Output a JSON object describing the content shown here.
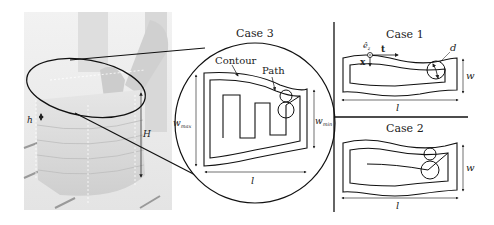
{
  "figure": {
    "photo": {
      "labels": {
        "h": "h",
        "H": "H"
      },
      "description": "3D printed layered block with robot arm"
    },
    "case3": {
      "title": "Case 3",
      "contour_label": "Contour",
      "path_label": "Path",
      "w_max": "w",
      "w_max_sub": "max",
      "w_min": "w",
      "w_min_sub": "min",
      "l": "l"
    },
    "case1": {
      "title": "Case 1",
      "e_label": "ê",
      "e_sub": "z",
      "x_label": "x",
      "t_label": "t",
      "d_label": "d",
      "w": "w",
      "l": "l"
    },
    "case2": {
      "title": "Case 2",
      "w": "w",
      "l": "l"
    }
  }
}
